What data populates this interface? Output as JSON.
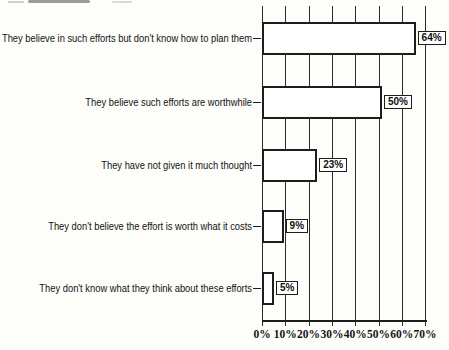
{
  "chart_data": {
    "type": "bar",
    "orientation": "horizontal",
    "title": "",
    "categories": [
      "They believe in such efforts but don't know how to plan them",
      "They believe such efforts are worthwhile",
      "They have not given it much thought",
      "They don't believe the effort is worth what it costs",
      "They don't know what they think about these efforts"
    ],
    "values": [
      64,
      50,
      23,
      9,
      5
    ],
    "value_labels": [
      "64%",
      "50%",
      "23%",
      "9%",
      "5%"
    ],
    "x_tick_labels": [
      "0%",
      "10%",
      "20%",
      "30%",
      "40%",
      "50%",
      "60%",
      "70%"
    ],
    "xlim": [
      0,
      70
    ],
    "x_tick_step": 10,
    "grid": "vertical gridlines at each 10% tick, drawn behind bars",
    "legend": "none",
    "bar_fill_color": "#ffffff",
    "line_color": "#1d1d1d"
  }
}
